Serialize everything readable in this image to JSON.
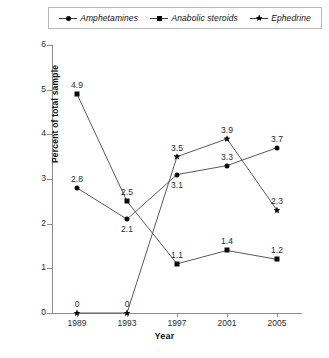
{
  "legend": {
    "position": "top",
    "items": [
      {
        "label": "Amphetamines",
        "marker": "circle-marker-icon"
      },
      {
        "label": "Anabolic steroids",
        "marker": "square-marker-icon"
      },
      {
        "label": "Ephedrine",
        "marker": "star-marker-icon"
      }
    ]
  },
  "axes": {
    "ylabel": "Percent of total sample",
    "xlabel": "Year",
    "yticks": [
      "0",
      "1",
      "2",
      "3",
      "4",
      "5",
      "6"
    ],
    "xticks": [
      "1989",
      "1993",
      "1997",
      "2001",
      "2005"
    ]
  },
  "chart_data": {
    "type": "line",
    "title": "",
    "xlabel": "Year",
    "ylabel": "Percent of total sample",
    "categories": [
      "1989",
      "1993",
      "1997",
      "2001",
      "2005"
    ],
    "x": [
      1989,
      1993,
      1997,
      2001,
      2005
    ],
    "ylim": [
      0,
      6
    ],
    "yticks": [
      0,
      1,
      2,
      3,
      4,
      5,
      6
    ],
    "grid": false,
    "legend_position": "top",
    "series": [
      {
        "name": "Amphetamines",
        "marker": "circle",
        "values": [
          2.8,
          2.1,
          3.1,
          3.3,
          3.7
        ],
        "labels": [
          "2.8",
          "2.1",
          "3.1",
          "3.3",
          "3.7"
        ],
        "label_side": [
          "above",
          "below",
          "below",
          "above",
          "above"
        ]
      },
      {
        "name": "Anabolic steroids",
        "marker": "square",
        "values": [
          4.9,
          2.5,
          1.1,
          1.4,
          1.2
        ],
        "labels": [
          "4.9",
          "2.5",
          "1.1",
          "1.4",
          "1.2"
        ],
        "label_side": [
          "above",
          "above",
          "above",
          "above",
          "above"
        ]
      },
      {
        "name": "Ephedrine",
        "marker": "star",
        "values": [
          0,
          0,
          3.5,
          3.9,
          2.3
        ],
        "labels": [
          "0",
          "0",
          "3.5",
          "3.9",
          "2.3"
        ],
        "label_side": [
          "above",
          "above",
          "above",
          "above",
          "above"
        ]
      }
    ]
  }
}
